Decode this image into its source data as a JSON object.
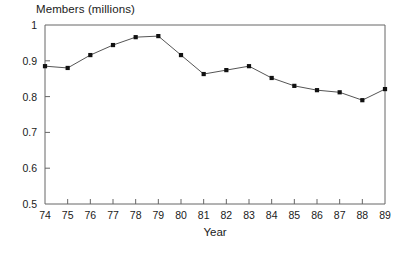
{
  "chart_data": {
    "type": "line",
    "title": "Members (millions)",
    "xlabel": "Year",
    "ylabel": "",
    "x": [
      74,
      75,
      76,
      77,
      78,
      79,
      80,
      81,
      82,
      83,
      84,
      85,
      86,
      87,
      88,
      89
    ],
    "x_tick_labels": [
      "74",
      "75",
      "76",
      "77",
      "78",
      "79",
      "80",
      "81",
      "82",
      "83",
      "84",
      "85",
      "86",
      "87",
      "88",
      "89"
    ],
    "values": [
      0.885,
      0.88,
      0.916,
      0.944,
      0.966,
      0.969,
      0.916,
      0.863,
      0.874,
      0.885,
      0.852,
      0.83,
      0.818,
      0.812,
      0.79,
      0.821
    ],
    "y_tick_labels": [
      "1",
      "0.9",
      "0.8",
      "0.7",
      "0.6",
      "0.5"
    ],
    "y_ticks": [
      1,
      0.9,
      0.8,
      0.7,
      0.6,
      0.5
    ],
    "ylim": [
      0.5,
      1.0
    ],
    "xlim": [
      74,
      89
    ],
    "grid": false,
    "legend": null,
    "marker": "square",
    "line_color": "#555555",
    "marker_color": "#111111",
    "axis_color": "#666666"
  },
  "labels": {
    "title": "Members (millions)",
    "x_axis_title": "Year"
  }
}
